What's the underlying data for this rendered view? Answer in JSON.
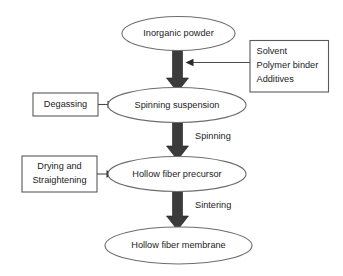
{
  "diagram": {
    "background_color": "#ffffff",
    "arrow_color": "#3b3b3b",
    "outline_color": "#6d6d6d",
    "text_color": "#222222",
    "nodes": [
      {
        "id": "inorganic-powder",
        "shape": "ellipse",
        "label": "Inorganic powder"
      },
      {
        "id": "spinning-suspension",
        "shape": "ellipse",
        "label": "Spinning suspension"
      },
      {
        "id": "hollow-fiber-precursor",
        "shape": "ellipse",
        "label": "Hollow fiber precursor"
      },
      {
        "id": "hollow-fiber-membrane",
        "shape": "ellipse",
        "label": "Hollow fiber membrane"
      }
    ],
    "side_boxes": [
      {
        "id": "additives-box",
        "shape": "rectangle",
        "align": "left",
        "lines": [
          "Solvent",
          "Polymer binder",
          "Additives"
        ]
      },
      {
        "id": "degassing-box",
        "shape": "rectangle",
        "align": "center",
        "lines": [
          "Degassing"
        ]
      },
      {
        "id": "drying-straightening-box",
        "shape": "rectangle",
        "align": "center",
        "lines": [
          "Drying and",
          "Straightening"
        ]
      }
    ],
    "edge_labels": [
      {
        "id": "spinning-label",
        "label": "Spinning"
      },
      {
        "id": "sintering-label",
        "label": "Sintering"
      }
    ]
  }
}
